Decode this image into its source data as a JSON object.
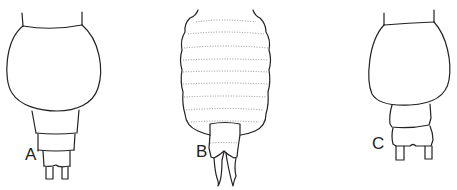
{
  "figure": {
    "panels": [
      {
        "id": "A",
        "label": "A",
        "description": "body outline, dorsal view, rounded cephalothorax with three segments and paired caudal rami"
      },
      {
        "id": "B",
        "label": "B",
        "description": "body outline with dotted transverse segment striations and pointed caudal rami"
      },
      {
        "id": "C",
        "label": "C",
        "description": "body outline, dorsal view, rounded cephalothorax with two segments and paired caudal rami"
      }
    ],
    "stroke_color": "#222222",
    "background": "#ffffff"
  }
}
